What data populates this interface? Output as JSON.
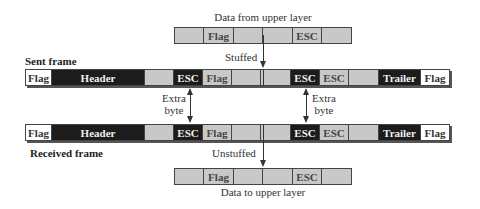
{
  "top": {
    "title": "Data from upper layer",
    "cells": [
      "",
      "Flag",
      "",
      "",
      "ESC",
      ""
    ],
    "arrow_label": "Stuffed"
  },
  "sent_frame": {
    "label": "Sent frame",
    "cells": [
      {
        "text": "Flag",
        "style": "white",
        "width": 27
      },
      {
        "text": "Header",
        "style": "dark",
        "width": 93
      },
      {
        "text": "",
        "style": "gray",
        "width": 29
      },
      {
        "text": "ESC",
        "style": "dark",
        "width": 29
      },
      {
        "text": "Flag",
        "style": "gray",
        "width": 29
      },
      {
        "text": "",
        "style": "gray",
        "width": 29
      },
      {
        "text": "",
        "style": "gray",
        "width": 30
      },
      {
        "text": "ESC",
        "style": "dark",
        "width": 29
      },
      {
        "text": "ESC",
        "style": "gray",
        "width": 29
      },
      {
        "text": "",
        "style": "gray",
        "width": 30
      },
      {
        "text": "Trailer",
        "style": "dark",
        "width": 42
      },
      {
        "text": "Flag",
        "style": "white",
        "width": 29
      }
    ]
  },
  "extra_byte_labels": [
    "Extra\nbyte",
    "Extra\nbyte"
  ],
  "extra_byte_1": {
    "line1": "Extra",
    "line2": "byte"
  },
  "extra_byte_2": {
    "line1": "Extra",
    "line2": "byte"
  },
  "received_frame": {
    "label": "Received frame",
    "cells": [
      {
        "text": "Flag",
        "style": "white",
        "width": 27
      },
      {
        "text": "Header",
        "style": "dark",
        "width": 93
      },
      {
        "text": "",
        "style": "gray",
        "width": 29
      },
      {
        "text": "ESC",
        "style": "dark",
        "width": 29
      },
      {
        "text": "Flag",
        "style": "gray",
        "width": 29
      },
      {
        "text": "",
        "style": "gray",
        "width": 29
      },
      {
        "text": "",
        "style": "gray",
        "width": 30
      },
      {
        "text": "ESC",
        "style": "dark",
        "width": 29
      },
      {
        "text": "ESC",
        "style": "gray",
        "width": 29
      },
      {
        "text": "",
        "style": "gray",
        "width": 30
      },
      {
        "text": "Trailer",
        "style": "dark",
        "width": 42
      },
      {
        "text": "Flag",
        "style": "white",
        "width": 29
      }
    ]
  },
  "bottom": {
    "title": "Data to upper layer",
    "cells": [
      "",
      "Flag",
      "",
      "",
      "ESC",
      ""
    ],
    "arrow_label": "Unstuffed"
  }
}
